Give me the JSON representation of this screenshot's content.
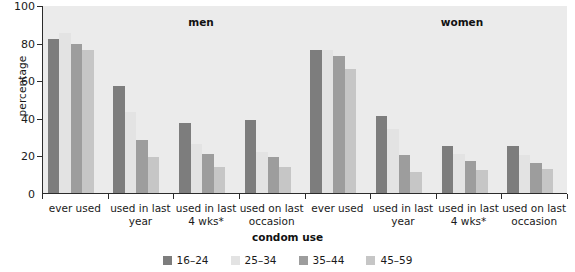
{
  "chart_data": {
    "type": "bar",
    "title": "",
    "xlabel": "condom use",
    "ylabel": "percentage",
    "ylim": [
      0,
      100
    ],
    "ytick_labels": [
      "0",
      "20",
      "40",
      "60",
      "80",
      "100"
    ],
    "ytick_values": [
      0,
      20,
      40,
      60,
      80,
      100
    ],
    "grid": false,
    "legend_position": "bottom",
    "panels": [
      {
        "name": "men",
        "title": "men",
        "categories": [
          "ever used",
          "used in last year",
          "used in last 4 wks*",
          "used on last occasion"
        ],
        "series": [
          {
            "name": "16–24",
            "color": "#7d7d7d",
            "values": [
              82,
              57,
              37,
              39
            ]
          },
          {
            "name": "25–34",
            "color": "#e3e3e3",
            "values": [
              85,
              43,
              26,
              22
            ]
          },
          {
            "name": "35–44",
            "color": "#9d9d9d",
            "values": [
              79,
              28,
              21,
              19
            ]
          },
          {
            "name": "45–59",
            "color": "#c6c6c6",
            "values": [
              76,
              19,
              14,
              14
            ]
          }
        ]
      },
      {
        "name": "women",
        "title": "women",
        "categories": [
          "ever used",
          "used in last year",
          "used in last 4 wks*",
          "used on last occasion"
        ],
        "series": [
          {
            "name": "16–24",
            "color": "#7d7d7d",
            "values": [
              76,
              41,
              25,
              25
            ]
          },
          {
            "name": "25–34",
            "color": "#e3e3e3",
            "values": [
              76,
              34,
              21,
              20
            ]
          },
          {
            "name": "35–44",
            "color": "#9d9d9d",
            "values": [
              73,
              20,
              17,
              16
            ]
          },
          {
            "name": "45–59",
            "color": "#c6c6c6",
            "values": [
              66,
              11,
              12,
              13
            ]
          }
        ]
      }
    ],
    "legend": [
      {
        "label": "16–24",
        "color": "#7d7d7d"
      },
      {
        "label": "25–34",
        "color": "#e3e3e3"
      },
      {
        "label": "35–44",
        "color": "#9d9d9d"
      },
      {
        "label": "45–59",
        "color": "#c6c6c6"
      }
    ]
  },
  "axes": {
    "y_label": "percentage",
    "x_label": "condom use"
  },
  "xcat_lines": {
    "ever_used": [
      "ever used"
    ],
    "used_in_last_year": [
      "used in last",
      "year"
    ],
    "used_in_last_4wks": [
      "used in last",
      "4 wks*"
    ],
    "used_on_last_occasion": [
      "used on last",
      "occasion"
    ]
  }
}
